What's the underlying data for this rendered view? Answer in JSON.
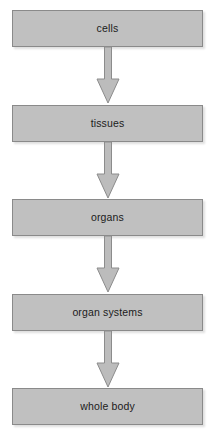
{
  "diagram": {
    "type": "vertical-flowchart",
    "direction": "top-to-bottom",
    "background_color": "#ffffff",
    "box_fill_color": "#c0c0c0",
    "box_border_color": "#8a8a8a",
    "arrow_fill_color": "#bcbcbc",
    "arrow_border_color": "#8c8c8c",
    "text_color": "#1b1b1b",
    "levels": [
      {
        "id": "cells",
        "label": "cells",
        "order": 1
      },
      {
        "id": "tissues",
        "label": "tissues",
        "order": 2
      },
      {
        "id": "organs",
        "label": "organs",
        "order": 3
      },
      {
        "id": "organ-systems",
        "label": "organ systems",
        "order": 4
      },
      {
        "id": "whole-body",
        "label": "whole body",
        "order": 5
      }
    ],
    "connectors": [
      {
        "id": "cells-to-tissues",
        "from": "cells",
        "to": "tissues",
        "glyph": "down-block-arrow"
      },
      {
        "id": "tissues-to-organs",
        "from": "tissues",
        "to": "organs",
        "glyph": "down-block-arrow"
      },
      {
        "id": "organs-to-organ-systems",
        "from": "organs",
        "to": "organ systems",
        "glyph": "down-block-arrow"
      },
      {
        "id": "organ-systems-to-whole-body",
        "from": "organ systems",
        "to": "whole body",
        "glyph": "down-block-arrow"
      }
    ]
  }
}
